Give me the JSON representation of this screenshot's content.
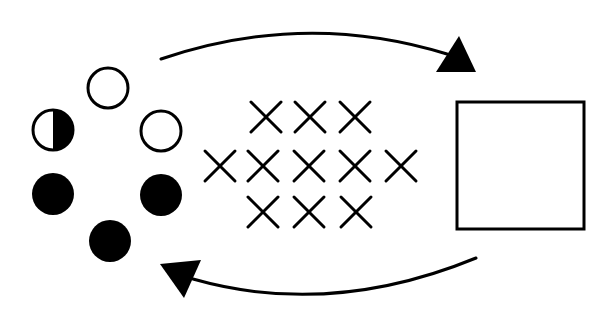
{
  "diagram": {
    "colors": {
      "ink": "#000000",
      "background": "#ffffff"
    },
    "circles": [
      {
        "id": "top",
        "cx": 108,
        "cy": 88,
        "r": 20,
        "fill": "open"
      },
      {
        "id": "upper-left",
        "cx": 53,
        "cy": 130,
        "r": 20,
        "fill": "half-right"
      },
      {
        "id": "upper-right",
        "cx": 161,
        "cy": 131,
        "r": 20,
        "fill": "open"
      },
      {
        "id": "lower-left",
        "cx": 53,
        "cy": 194,
        "r": 21,
        "fill": "solid"
      },
      {
        "id": "lower-right",
        "cx": 161,
        "cy": 195,
        "r": 21,
        "fill": "solid"
      },
      {
        "id": "bottom",
        "cx": 110,
        "cy": 241,
        "r": 21,
        "fill": "solid"
      }
    ],
    "crosses": [
      {
        "x": 266,
        "y": 117
      },
      {
        "x": 310,
        "y": 117
      },
      {
        "x": 355,
        "y": 117
      },
      {
        "x": 220,
        "y": 166
      },
      {
        "x": 263,
        "y": 166
      },
      {
        "x": 309,
        "y": 166
      },
      {
        "x": 355,
        "y": 166
      },
      {
        "x": 401,
        "y": 166
      },
      {
        "x": 263,
        "y": 212
      },
      {
        "x": 309,
        "y": 212
      },
      {
        "x": 356,
        "y": 212
      }
    ],
    "cross_half_size": 15,
    "square": {
      "x": 457,
      "y": 102,
      "width": 127,
      "height": 127
    },
    "arrows": [
      {
        "id": "top-arrow",
        "direction": "right",
        "path": "M161 59 Q305 10 447 54",
        "head": "436,72 476,72 459,36"
      },
      {
        "id": "bottom-arrow",
        "direction": "left",
        "path": "M476 258 Q330 318 193 279",
        "head": "160,264 201,260 184,298"
      }
    ]
  }
}
